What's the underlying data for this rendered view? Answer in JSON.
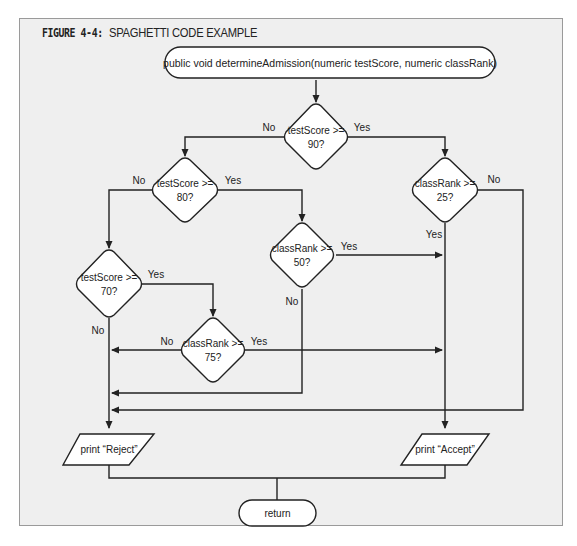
{
  "figure": {
    "label": "FIGURE 4-4:",
    "caption": "SPAGHETTI CODE EXAMPLE"
  },
  "flowchart": {
    "start": {
      "text": "public void determineAdmission(numeric testScore, numeric classRank)"
    },
    "decisions": [
      {
        "id": "d1",
        "line1": "testScore >=",
        "line2": "90?",
        "yes": "Yes",
        "no": "No"
      },
      {
        "id": "d2",
        "line1": "testScore >=",
        "line2": "80?",
        "yes": "Yes",
        "no": "No"
      },
      {
        "id": "d3",
        "line1": "classRank >=",
        "line2": "25?",
        "yes": "Yes",
        "no": "No"
      },
      {
        "id": "d4",
        "line1": "classRank >=",
        "line2": "50?",
        "yes": "Yes",
        "no": "No"
      },
      {
        "id": "d5",
        "line1": "testScore >=",
        "line2": "70?",
        "yes": "Yes",
        "no": "No"
      },
      {
        "id": "d6",
        "line1": "classRank >=",
        "line2": "75?",
        "yes": "Yes",
        "no": "No"
      }
    ],
    "outputs": [
      {
        "id": "reject",
        "text": "print “Reject”"
      },
      {
        "id": "accept",
        "text": "print “Accept”"
      }
    ],
    "end": {
      "text": "return"
    }
  },
  "colors": {
    "background": "#efefef",
    "stroke": "#222222",
    "shape_fill": "#ffffff"
  }
}
